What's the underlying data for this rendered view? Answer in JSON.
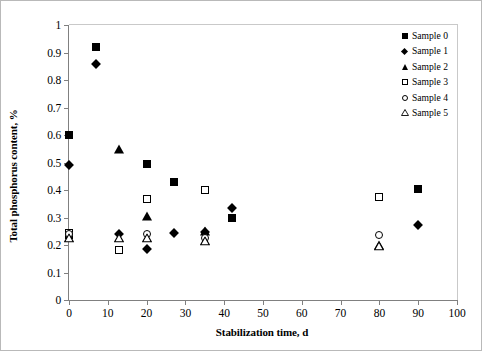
{
  "chart_data": {
    "type": "scatter",
    "title": "",
    "xlabel": "Stabilization time, d",
    "ylabel": "Total phosphorus content, %",
    "xlim": [
      0,
      100
    ],
    "ylim": [
      0,
      1
    ],
    "xticks": [
      0,
      10,
      20,
      30,
      40,
      50,
      60,
      70,
      80,
      90,
      100
    ],
    "yticks": [
      0,
      0.1,
      0.2,
      0.3,
      0.4,
      0.5,
      0.6,
      0.7,
      0.8,
      0.9,
      1
    ],
    "xtick_labels": [
      "0",
      "10",
      "20",
      "30",
      "40",
      "50",
      "60",
      "70",
      "80",
      "90",
      "100"
    ],
    "ytick_labels": [
      "0",
      "0.1",
      "0.2",
      "0.3",
      "0.4",
      "0.5",
      "0.6",
      "0.7",
      "0.8",
      "0.9",
      "1"
    ],
    "grid": false,
    "legend_position": "top-right",
    "series": [
      {
        "name": "Sample 0",
        "marker": "filled-square",
        "color": "#000000",
        "points": [
          {
            "x": 0,
            "y": 0.6
          },
          {
            "x": 0,
            "y": 0.235
          },
          {
            "x": 7,
            "y": 0.92
          },
          {
            "x": 20,
            "y": 0.493
          },
          {
            "x": 27,
            "y": 0.43
          },
          {
            "x": 42,
            "y": 0.3
          },
          {
            "x": 90,
            "y": 0.405
          }
        ]
      },
      {
        "name": "Sample 1",
        "marker": "filled-diamond",
        "color": "#000000",
        "points": [
          {
            "x": 0,
            "y": 0.49
          },
          {
            "x": 7,
            "y": 0.86
          },
          {
            "x": 13,
            "y": 0.24
          },
          {
            "x": 20,
            "y": 0.185
          },
          {
            "x": 27,
            "y": 0.245
          },
          {
            "x": 35,
            "y": 0.247
          },
          {
            "x": 42,
            "y": 0.335
          },
          {
            "x": 90,
            "y": 0.272
          }
        ]
      },
      {
        "name": "Sample 2",
        "marker": "filled-triangle",
        "color": "#000000",
        "points": [
          {
            "x": 13,
            "y": 0.55
          },
          {
            "x": 20,
            "y": 0.305
          },
          {
            "x": 35,
            "y": 0.25
          },
          {
            "x": 80,
            "y": 0.2
          }
        ]
      },
      {
        "name": "Sample 3",
        "marker": "open-square",
        "color": "#000000",
        "points": [
          {
            "x": 0,
            "y": 0.242
          },
          {
            "x": 13,
            "y": 0.182
          },
          {
            "x": 20,
            "y": 0.368
          },
          {
            "x": 35,
            "y": 0.4
          },
          {
            "x": 80,
            "y": 0.373
          }
        ]
      },
      {
        "name": "Sample 4",
        "marker": "open-circle",
        "color": "#000000",
        "points": [
          {
            "x": 0,
            "y": 0.24
          },
          {
            "x": 20,
            "y": 0.24
          },
          {
            "x": 35,
            "y": 0.224
          },
          {
            "x": 80,
            "y": 0.238
          }
        ]
      },
      {
        "name": "Sample 5",
        "marker": "open-triangle",
        "color": "#000000",
        "points": [
          {
            "x": 0,
            "y": 0.245
          },
          {
            "x": 13,
            "y": 0.243
          },
          {
            "x": 20,
            "y": 0.243
          },
          {
            "x": 35,
            "y": 0.232
          },
          {
            "x": 80,
            "y": 0.214
          }
        ]
      }
    ]
  },
  "axes": {
    "x_title": "Stabilization time, d",
    "y_title": "Total phosphorus content, %"
  },
  "legend": {
    "items": [
      {
        "label": "Sample 0",
        "marker": "filled-square"
      },
      {
        "label": "Sample 1",
        "marker": "filled-diamond"
      },
      {
        "label": "Sample 2",
        "marker": "filled-triangle"
      },
      {
        "label": "Sample 3",
        "marker": "open-square"
      },
      {
        "label": "Sample 4",
        "marker": "open-circle"
      },
      {
        "label": "Sample 5",
        "marker": "open-triangle"
      }
    ]
  },
  "colors": {
    "marker": "#000000",
    "axis": "#808080",
    "frame": "#b9b9b9",
    "background": "#ffffff"
  }
}
